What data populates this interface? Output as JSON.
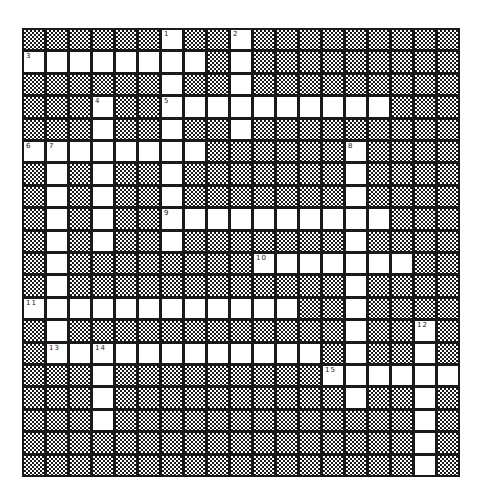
{
  "puzzle": {
    "cols": 19,
    "rows": 20,
    "colors": {
      "grid_line": "#1a1a1a",
      "open_cell": "#ffffff",
      "block_pattern": "checker"
    },
    "open_cells": [
      [
        6,
        9
      ],
      [
        0,
        1,
        2,
        3,
        4,
        5,
        6,
        7,
        9
      ],
      [
        6,
        9
      ],
      [
        3,
        6,
        7,
        8,
        9,
        10,
        11,
        12,
        13,
        14,
        15
      ],
      [
        3,
        6,
        9
      ],
      [
        0,
        1,
        2,
        3,
        4,
        5,
        6,
        7,
        14
      ],
      [
        1,
        3,
        6,
        14
      ],
      [
        1,
        3,
        6,
        14
      ],
      [
        1,
        3,
        6,
        7,
        8,
        9,
        10,
        11,
        12,
        13,
        14,
        15
      ],
      [
        1,
        3,
        6,
        14
      ],
      [
        1,
        10,
        11,
        12,
        13,
        14,
        15,
        16
      ],
      [
        1,
        14
      ],
      [
        0,
        1,
        2,
        3,
        4,
        5,
        6,
        7,
        8,
        9,
        10,
        11,
        14
      ],
      [
        1,
        14,
        17
      ],
      [
        1,
        2,
        3,
        4,
        5,
        6,
        7,
        8,
        9,
        10,
        11,
        12,
        14,
        17
      ],
      [
        3,
        13,
        14,
        15,
        16,
        17,
        18
      ],
      [
        3,
        14,
        17
      ],
      [
        3,
        17
      ],
      [
        17
      ],
      [
        17
      ]
    ],
    "clue_numbers": [
      {
        "n": "1",
        "row": 0,
        "col": 6
      },
      {
        "n": "2",
        "row": 0,
        "col": 9
      },
      {
        "n": "3",
        "row": 1,
        "col": 0
      },
      {
        "n": "4",
        "row": 3,
        "col": 3
      },
      {
        "n": "5",
        "row": 3,
        "col": 6
      },
      {
        "n": "6",
        "row": 5,
        "col": 0
      },
      {
        "n": "7",
        "row": 5,
        "col": 1
      },
      {
        "n": "8",
        "row": 5,
        "col": 14
      },
      {
        "n": "9",
        "row": 8,
        "col": 6
      },
      {
        "n": "10",
        "row": 10,
        "col": 10
      },
      {
        "n": "11",
        "row": 12,
        "col": 0
      },
      {
        "n": "12",
        "row": 13,
        "col": 17
      },
      {
        "n": "13",
        "row": 14,
        "col": 1
      },
      {
        "n": "14",
        "row": 14,
        "col": 3
      },
      {
        "n": "15",
        "row": 15,
        "col": 13
      }
    ]
  }
}
